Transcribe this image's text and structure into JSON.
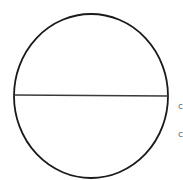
{
  "diagram": {
    "shape": "circle",
    "stroke_color": "#1a1a1a",
    "divider_color": "#3a3a3a",
    "background": "#ffffff",
    "center": [
      91,
      96
    ],
    "radius_x": 77,
    "radius_y": 82,
    "divider": {
      "x1": 13,
      "y1": 95,
      "x2": 168,
      "y2": 96
    },
    "edge_labels": [
      {
        "text": "c",
        "x": 178,
        "y": 102
      },
      {
        "text": "c",
        "x": 178,
        "y": 130
      }
    ]
  }
}
